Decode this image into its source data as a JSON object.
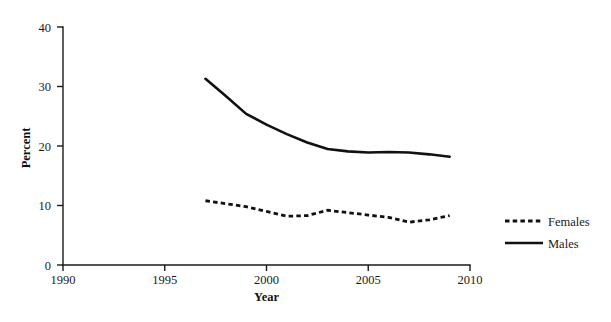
{
  "chart_data": {
    "type": "line",
    "title": "",
    "xlabel": "Year",
    "ylabel": "Percent",
    "xlim": [
      1990,
      2010
    ],
    "ylim": [
      0,
      40
    ],
    "xticks": [
      1990,
      1995,
      2000,
      2005,
      2010
    ],
    "yticks": [
      0,
      10,
      20,
      30,
      40
    ],
    "grid": false,
    "legend_position": "right",
    "x": [
      1997,
      1998,
      1999,
      2000,
      2001,
      2002,
      2003,
      2004,
      2005,
      2006,
      2007,
      2008,
      2009
    ],
    "series": [
      {
        "name": "Females",
        "style": "dashed",
        "color": "#111111",
        "values": [
          10.8,
          10.3,
          9.8,
          9.0,
          8.2,
          8.3,
          9.2,
          8.8,
          8.4,
          8.0,
          7.2,
          7.6,
          8.3
        ]
      },
      {
        "name": "Males",
        "style": "solid",
        "color": "#111111",
        "values": [
          31.3,
          28.4,
          25.4,
          23.6,
          22.0,
          20.6,
          19.5,
          19.1,
          18.9,
          19.0,
          18.9,
          18.6,
          18.2
        ]
      }
    ]
  },
  "axes": {
    "x_tick_labels": [
      "1990",
      "1995",
      "2000",
      "2005",
      "2010"
    ],
    "y_tick_labels": [
      "0",
      "10",
      "20",
      "30",
      "40"
    ],
    "x_axis_title": "Year",
    "y_axis_title": "Percent"
  },
  "legend": {
    "items": [
      {
        "label": "Females",
        "style": "dashed"
      },
      {
        "label": "Males",
        "style": "solid"
      }
    ]
  }
}
